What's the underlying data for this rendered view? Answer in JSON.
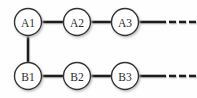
{
  "diagram": {
    "background_color": "#fefefe",
    "node_fill": "#ffffff",
    "node_stroke": "#333333",
    "node_stroke_width": 1.4,
    "node_radius": 13.5,
    "label_color": "#2b2b2b",
    "edge_color": "#1c1c1c",
    "edge_width": 2.6,
    "shadow_color": "#c8c8c8",
    "rows": [
      {
        "id": "row-a",
        "name": "top-row",
        "center_y": 22,
        "nodes": [
          {
            "id": "A1",
            "label": "A1",
            "cx": 28,
            "cy": 22
          },
          {
            "id": "A2",
            "label": "A2",
            "cx": 77,
            "cy": 22
          },
          {
            "id": "A3",
            "label": "A3",
            "cx": 125,
            "cy": 22
          }
        ],
        "edges": [
          {
            "from": "A1",
            "to": "A2",
            "x1": 41.5,
            "x2": 63.5,
            "y": 22
          },
          {
            "from": "A2",
            "to": "A3",
            "x1": 90.5,
            "x2": 111.5,
            "y": 22
          },
          {
            "from": "A3",
            "to": "ellipsis-a",
            "x1": 138.5,
            "x2": 166,
            "y": 22
          }
        ],
        "ellipsis": {
          "id": "ellipsis-a",
          "label": "…",
          "dashes": [
            {
              "x": 169,
              "y": 20.7,
              "w": 7,
              "h": 2.6
            },
            {
              "x": 179,
              "y": 20.7,
              "w": 7,
              "h": 2.6
            },
            {
              "x": 189,
              "y": 20.7,
              "w": 7,
              "h": 2.6
            }
          ]
        }
      },
      {
        "id": "row-b",
        "name": "bottom-row",
        "center_y": 76,
        "nodes": [
          {
            "id": "B1",
            "label": "B1",
            "cx": 28,
            "cy": 76
          },
          {
            "id": "B2",
            "label": "B2",
            "cx": 77,
            "cy": 76
          },
          {
            "id": "B3",
            "label": "B3",
            "cx": 125,
            "cy": 76
          }
        ],
        "edges": [
          {
            "from": "B1",
            "to": "B2",
            "x1": 41.5,
            "x2": 63.5,
            "y": 76
          },
          {
            "from": "B2",
            "to": "B3",
            "x1": 90.5,
            "x2": 111.5,
            "y": 76
          },
          {
            "from": "B3",
            "to": "ellipsis-b",
            "x1": 138.5,
            "x2": 166,
            "y": 76
          }
        ],
        "ellipsis": {
          "id": "ellipsis-b",
          "label": "…",
          "dashes": [
            {
              "x": 169,
              "y": 74.7,
              "w": 7,
              "h": 2.6
            },
            {
              "x": 179,
              "y": 74.7,
              "w": 7,
              "h": 2.6
            },
            {
              "x": 189,
              "y": 74.7,
              "w": 7,
              "h": 2.6
            }
          ]
        }
      }
    ],
    "vertical_edges": [
      {
        "id": "A1-B1",
        "from": "A1",
        "to": "B1",
        "x": 28,
        "y1": 35.5,
        "y2": 62.5
      }
    ]
  }
}
